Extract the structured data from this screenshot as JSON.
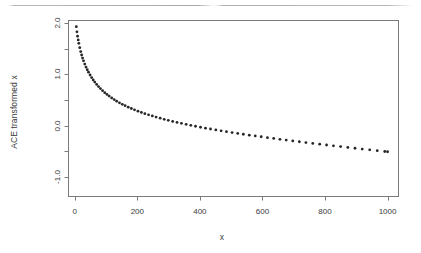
{
  "figure": {
    "page_rule_present": true,
    "background_color": "#ffffff",
    "axis_color": "#7a7a7a",
    "point_color": "#262626"
  },
  "chart_data": {
    "type": "scatter",
    "title": "",
    "subtitle": "",
    "xlabel": "x",
    "ylabel": "ACE transformed x",
    "xlim": [
      -20,
      1035
    ],
    "ylim": [
      -1.38,
      2.05
    ],
    "xticks": [
      0,
      200,
      400,
      600,
      800,
      1000
    ],
    "xtick_labels": [
      "0",
      "200",
      "400",
      "600",
      "800",
      "1000"
    ],
    "yticks": [
      -1.0,
      0.0,
      1.0,
      2.0
    ],
    "ytick_labels": [
      "-1.0",
      "0.0",
      "1.0",
      "2.0"
    ],
    "yticks_minor": [
      -0.5,
      0.5,
      1.5
    ],
    "grid": false,
    "legend": null,
    "marker": "filled-circle",
    "marker_size": 1.4,
    "n_points": 100,
    "x": [
      5,
      7,
      9,
      11,
      13,
      16,
      19,
      22,
      25,
      28,
      32,
      36,
      40,
      44,
      49,
      54,
      59,
      64,
      70,
      76,
      82,
      89,
      96,
      103,
      110,
      118,
      126,
      134,
      143,
      152,
      161,
      171,
      181,
      191,
      202,
      213,
      224,
      236,
      248,
      260,
      273,
      286,
      299,
      313,
      327,
      341,
      356,
      371,
      386,
      402,
      418,
      434,
      451,
      468,
      485,
      503,
      521,
      539,
      558,
      577,
      596,
      616,
      636,
      656,
      676,
      697,
      718,
      739,
      761,
      783,
      805,
      827,
      850,
      873,
      896,
      919,
      943,
      967,
      991,
      1000
    ],
    "y": [
      1.93,
      1.83,
      1.745,
      1.672,
      1.606,
      1.52,
      1.444,
      1.378,
      1.318,
      1.265,
      1.2,
      1.142,
      1.09,
      1.042,
      0.988,
      0.938,
      0.892,
      0.85,
      0.804,
      0.762,
      0.724,
      0.682,
      0.644,
      0.609,
      0.577,
      0.541,
      0.508,
      0.478,
      0.446,
      0.417,
      0.39,
      0.361,
      0.335,
      0.31,
      0.283,
      0.258,
      0.235,
      0.212,
      0.19,
      0.168,
      0.146,
      0.125,
      0.105,
      0.084,
      0.064,
      0.046,
      0.026,
      0.007,
      -0.011,
      -0.03,
      -0.048,
      -0.065,
      -0.083,
      -0.1,
      -0.117,
      -0.134,
      -0.151,
      -0.167,
      -0.184,
      -0.2,
      -0.216,
      -0.233,
      -0.249,
      -0.265,
      -0.281,
      -0.297,
      -0.313,
      -0.329,
      -0.345,
      -0.361,
      -0.376,
      -0.392,
      -0.408,
      -0.424,
      -0.44,
      -0.455,
      -0.471,
      -0.487,
      -0.503,
      -0.508
    ]
  },
  "axis_titles": {
    "x": "x",
    "y": "ACE transformed x"
  }
}
